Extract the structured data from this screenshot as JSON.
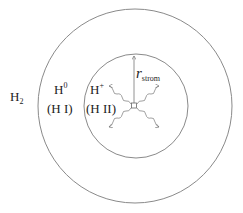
{
  "diagram": {
    "type": "stromgren-sphere",
    "outer_region": {
      "label": "H",
      "subscript": "2"
    },
    "neutral_shell": {
      "ion": "H",
      "superscript": "0",
      "notation": "(H I)"
    },
    "ionized_sphere": {
      "ion": "H",
      "superscript": "+",
      "notation": "(H II)"
    },
    "radius": {
      "symbol": "r",
      "subscript": "strom"
    },
    "central_source": "star",
    "photon_arrows": 4,
    "colors": {
      "lines": "#8a8a8a",
      "text": "#222222",
      "background": "#ffffff"
    }
  }
}
